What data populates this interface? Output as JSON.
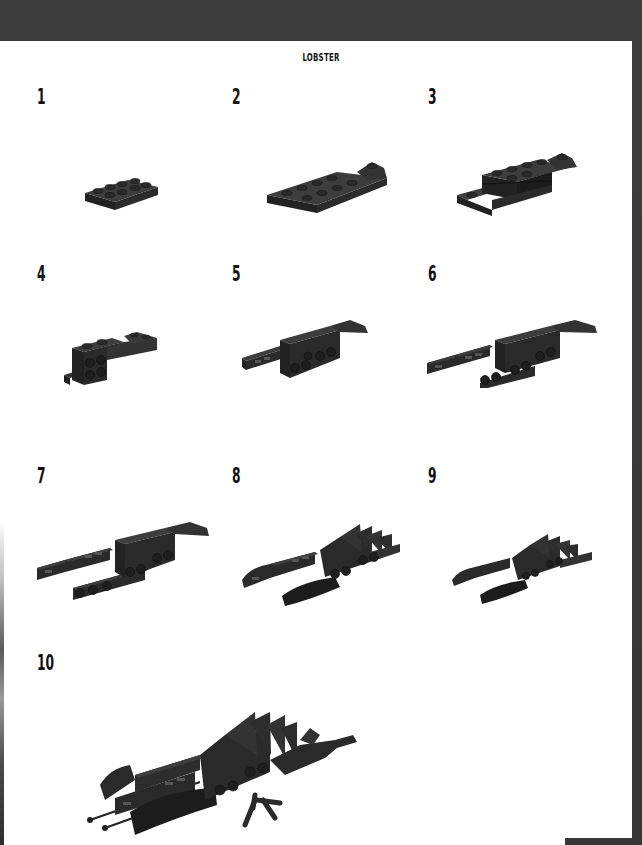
{
  "page": {
    "title": "LOBSTER",
    "colors": {
      "frame": "#3a3a3a",
      "page": "#ffffff",
      "brick": "#2b2b2b",
      "brick_top": "#3d3d3d",
      "text": "#111111"
    }
  },
  "steps": [
    {
      "number": "1",
      "description": "2x4 plate"
    },
    {
      "number": "2",
      "description": "plate with angled extension"
    },
    {
      "number": "3",
      "description": "stacked plates and tiles"
    },
    {
      "number": "4",
      "description": "bracket with side studs"
    },
    {
      "number": "5",
      "description": "claw arms begin"
    },
    {
      "number": "6",
      "description": "extended claw arms"
    },
    {
      "number": "7",
      "description": "full claw arms"
    },
    {
      "number": "8",
      "description": "tail fins and curved claws"
    },
    {
      "number": "9",
      "description": "compact lobster body"
    },
    {
      "number": "10",
      "description": "completed lobster with antennae and legs"
    }
  ]
}
